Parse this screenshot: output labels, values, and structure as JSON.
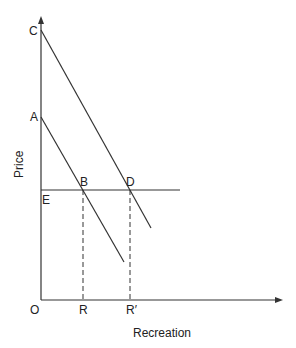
{
  "diagram": {
    "type": "economics-demand-diagram",
    "axes": {
      "y_label": "Price",
      "x_label": "Recreation",
      "origin_label": "O"
    },
    "points": {
      "C": "C",
      "A": "A",
      "E": "E",
      "B": "B",
      "D": "D",
      "R": "R",
      "R_prime": "R′"
    },
    "lines": [
      {
        "name": "demand-curve-upper",
        "from": "C",
        "description": "Higher demand curve from C through D"
      },
      {
        "name": "demand-curve-lower",
        "from": "A",
        "description": "Lower demand curve from A through B"
      },
      {
        "name": "price-line",
        "from": "E",
        "description": "Horizontal price line through B and D"
      },
      {
        "name": "dashed-drop-B",
        "from": "B",
        "to": "R"
      },
      {
        "name": "dashed-drop-D",
        "from": "D",
        "to": "R′"
      }
    ],
    "colors": {
      "line": "#333333",
      "background": "#ffffff"
    }
  }
}
